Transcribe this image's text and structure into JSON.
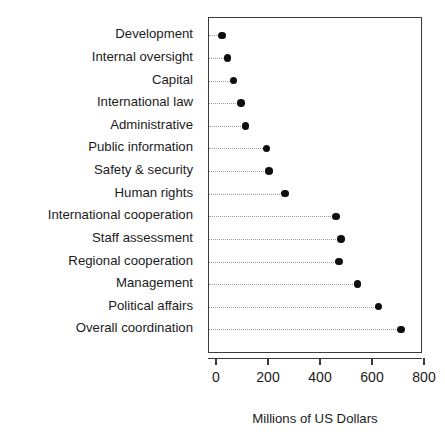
{
  "chart_data": {
    "type": "scatter",
    "subtype": "cleveland-dot-plot",
    "title": "",
    "xlabel": "Millions of US Dollars",
    "ylabel": "",
    "xlim": [
      0,
      800
    ],
    "xticks": [
      0,
      200,
      400,
      600,
      800
    ],
    "xtick_labels": [
      "0",
      "200",
      "400",
      "600",
      "800"
    ],
    "grid": false,
    "guide_lines": "dotted",
    "legend": null,
    "marker": "filled-circle",
    "marker_color": "#0d0d12",
    "panel_border_color": "#3a3a44",
    "background_color": "#ffffff",
    "categories": [
      "Development",
      "Internal oversight",
      "Capital",
      "International law",
      "Administrative",
      "Public information",
      "Safety & security",
      "Human rights",
      "International cooperation",
      "Staff assessment",
      "Regional cooperation",
      "Management",
      "Political affairs",
      "Overall coordination"
    ],
    "values": [
      19,
      40,
      63,
      92,
      110,
      190,
      200,
      262,
      458,
      477,
      470,
      541,
      622,
      708
    ],
    "points": [
      {
        "category": "Development",
        "value": 19
      },
      {
        "category": "Internal oversight",
        "value": 40
      },
      {
        "category": "Capital",
        "value": 63
      },
      {
        "category": "International law",
        "value": 92
      },
      {
        "category": "Administrative",
        "value": 110
      },
      {
        "category": "Public information",
        "value": 190
      },
      {
        "category": "Safety & security",
        "value": 200
      },
      {
        "category": "Human rights",
        "value": 262
      },
      {
        "category": "International cooperation",
        "value": 458
      },
      {
        "category": "Staff assessment",
        "value": 477
      },
      {
        "category": "Regional cooperation",
        "value": 470
      },
      {
        "category": "Management",
        "value": 541
      },
      {
        "category": "Political affairs",
        "value": 622
      },
      {
        "category": "Overall coordination",
        "value": 708
      }
    ]
  }
}
